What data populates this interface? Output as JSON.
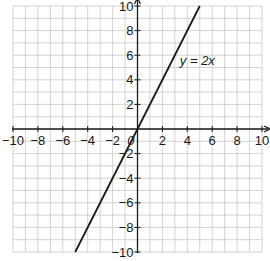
{
  "chart_data": {
    "type": "line",
    "title": "",
    "xlabel": "x",
    "ylabel": "y",
    "xlim": [
      -10,
      10
    ],
    "ylim": [
      -10,
      10
    ],
    "grid": true,
    "grid_step": 1,
    "x_ticks": [
      -10,
      -8,
      -6,
      -4,
      -2,
      2,
      4,
      6,
      8,
      10
    ],
    "y_ticks": [
      -10,
      -8,
      -6,
      -4,
      -2,
      2,
      4,
      6,
      8,
      10
    ],
    "origin_label": "0",
    "series": [
      {
        "name": "y = 2x",
        "equation": "y = 2x",
        "x": [
          -5,
          5
        ],
        "y": [
          -10,
          10
        ]
      }
    ],
    "annotations": [
      {
        "text": "y = 2x",
        "x": 3.4,
        "y": 5.2
      }
    ]
  },
  "colors": {
    "grid": "#c8c8c8",
    "axis": "#1a1a1a",
    "line": "#1a1a1a"
  }
}
